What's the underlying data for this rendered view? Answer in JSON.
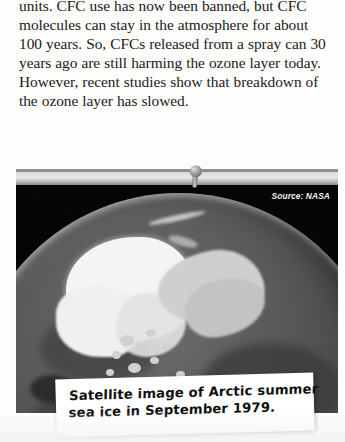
{
  "page": {
    "background_color": "#fdfdfb",
    "text_color": "#1b1b1b"
  },
  "body_text": {
    "lines": [
      "units. CFC use has now been banned, but CFC",
      "molecules can stay in the atmosphere for about",
      "100 years. So, CFCs released from a spray can 30",
      "years ago are still harming the ozone layer today.",
      "However, recent studies show that breakdown of",
      "the ozone layer has slowed."
    ],
    "full_text": "units. CFC use has now been banned, but CFC molecules can stay in the atmosphere for about 100 years. So, CFCs released from a spray can 30 years ago are still harming the ozone layer today. However, recent studies show that breakdown of the ozone layer has slowed."
  },
  "photo": {
    "source_label": "Source: NASA",
    "subject": "arctic-sea-ice-satellite-globe",
    "background_color": "#050505",
    "ice_color": "#f4f4f2",
    "ocean_color": "#4f4f4f",
    "land_color": "#cfcfcd"
  },
  "pushpin": {
    "name": "pushpin",
    "head_color": "#9a9a9a",
    "body_color": "#8a8a8a"
  },
  "caption": {
    "lines": [
      "Satellite image of Arctic summer",
      "sea ice in September 1979."
    ],
    "full_text": "Satellite image of Arctic summer sea ice in September 1979.",
    "card_color": "#ffffff"
  },
  "credit": {
    "text": ": (br) ©NASA/Goddard Space Flight Center Scientific Visualization Studio. Thanks to Rob Gerston (GSFC) for providing the data",
    "color": "#5d5d5d"
  }
}
